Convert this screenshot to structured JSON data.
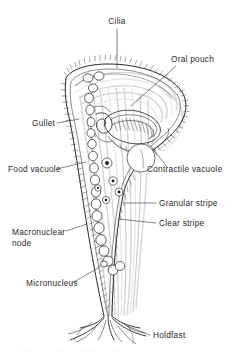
{
  "figure": {
    "kind": "biological line drawing",
    "background_color": "#ffffff",
    "ink_color": "#1e1e1e",
    "label_color": "#2b2b2b",
    "stripe_color": "#d8d8d8",
    "caption_ghost": "Figure cut off at bottom edge"
  },
  "labels": [
    {
      "id": "cilia",
      "text": "Cilia",
      "align": "middle",
      "x": 117,
      "y": 24
    },
    {
      "id": "oral-pouch",
      "text": "Oral pouch",
      "align": "start",
      "x": 171,
      "y": 62
    },
    {
      "id": "gullet",
      "text": "Gullet",
      "align": "start",
      "x": 32,
      "y": 126
    },
    {
      "id": "food-vacuole",
      "text": "Food vacuole",
      "align": "start",
      "x": 8,
      "y": 172
    },
    {
      "id": "contractile-vacuole",
      "text": "Contractile vacuole",
      "align": "start",
      "x": 147,
      "y": 172
    },
    {
      "id": "granular-stripe",
      "text": "Granular stripe",
      "align": "start",
      "x": 159,
      "y": 206
    },
    {
      "id": "clear-stripe",
      "text": "Clear stripe",
      "align": "start",
      "x": 159,
      "y": 226
    },
    {
      "id": "macronuclear-node-1",
      "text": "Macronuclear",
      "align": "start",
      "x": 12,
      "y": 235
    },
    {
      "id": "macronuclear-node-2",
      "text": "node",
      "align": "start",
      "x": 12,
      "y": 246
    },
    {
      "id": "micronucleus",
      "text": "Micronucleus",
      "align": "start",
      "x": 26,
      "y": 286
    },
    {
      "id": "holdfast",
      "text": "Holdfast",
      "align": "start",
      "x": 153,
      "y": 338
    }
  ],
  "leaders": [
    {
      "id": "leader-cilia",
      "d": "M117 29 L117 68"
    },
    {
      "id": "leader-oral-pouch",
      "d": "M176 66 L131 106"
    },
    {
      "id": "leader-gullet",
      "d": "M57 123 L79 119"
    },
    {
      "id": "leader-food-vacuole",
      "d": "M57 169 L86 162"
    },
    {
      "id": "leader-contractile-vacuole",
      "d": "M167 167 L150 145"
    },
    {
      "id": "leader-granular-stripe",
      "d": "M156 203 L124 203"
    },
    {
      "id": "leader-clear-stripe",
      "d": "M156 223 L118 219"
    },
    {
      "id": "leader-macronuclear-node",
      "d": "M66 231 L87 224"
    },
    {
      "id": "leader-micronucleus",
      "d": "M72 283 L100 267"
    },
    {
      "id": "leader-holdfast",
      "d": "M150 335 L127 326"
    }
  ],
  "structures": {
    "body_outline": "trumpet-shaped cell with flared peristome rim at top and tapering stalk to holdfast",
    "cilia_fringe": "dense hair-like cilia along peristome rim and body wall",
    "macronuclear_chain": "beaded moniliform chain running down left of cell",
    "food_vacuoles": "small circles with central dark granule",
    "contractile_vacuole": "large empty circle below oral pouch",
    "holdfast": "branching root-like attachment at base"
  }
}
